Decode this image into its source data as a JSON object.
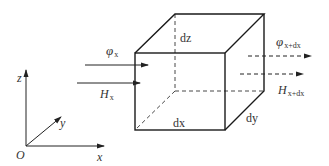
{
  "diagram": {
    "colors": {
      "stroke": "#222222",
      "text": "#333333",
      "background": "#ffffff"
    },
    "axes": {
      "origin_label": "O",
      "x_label": "x",
      "y_label": "y",
      "z_label": "z"
    },
    "cube": {
      "edge_labels": {
        "dx": "dx",
        "dy": "dy",
        "dz": "dz"
      }
    },
    "incoming": {
      "flux": {
        "symbol": "φ",
        "subscript": "x"
      },
      "field": {
        "symbol": "H",
        "subscript": "x"
      }
    },
    "outgoing": {
      "flux": {
        "symbol": "φ",
        "subscript": "x+dx"
      },
      "field": {
        "symbol": "H",
        "subscript": "x+dx"
      }
    }
  }
}
